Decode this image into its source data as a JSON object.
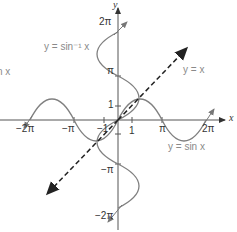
{
  "diagram": {
    "axes": {
      "x_label": "x",
      "y_label": "y"
    },
    "x_ticks": [
      {
        "label": "-2π",
        "value": -6.283
      },
      {
        "label": "-π",
        "value": -3.1416
      },
      {
        "label": "-1",
        "value": -1
      },
      {
        "label": "1",
        "value": 1
      },
      {
        "label": "π",
        "value": 3.1416
      },
      {
        "label": "2π",
        "value": 6.283
      }
    ],
    "y_ticks": [
      {
        "label": "2π",
        "value": 6.283
      },
      {
        "label": "π",
        "value": 3.1416
      },
      {
        "label": "1",
        "value": 1
      },
      {
        "label": "-1",
        "value": -1
      },
      {
        "label": "-π",
        "value": -3.1416
      },
      {
        "label": "-2π",
        "value": -6.283
      }
    ],
    "labels": {
      "x_neg2pi": "−2π",
      "x_negpi": "−π",
      "x_neg1": "−1",
      "x_1": "1",
      "x_pi": "π",
      "x_2pi": "2π",
      "y_2pi": "2π",
      "y_pi": "π",
      "y_1": "1",
      "y_negpi": "−π",
      "y_neg2pi": "−2π"
    },
    "curves": [
      {
        "name": "sine",
        "label": "y = sin x",
        "style": "solid",
        "color": "#808080"
      },
      {
        "name": "inverse-sine",
        "label": "y = sin⁻¹ x",
        "style": "solid",
        "color": "#808080"
      },
      {
        "name": "identity",
        "label": "y = x",
        "style": "dashed",
        "color": "#222222"
      }
    ],
    "partial_text_left": "n x"
  }
}
